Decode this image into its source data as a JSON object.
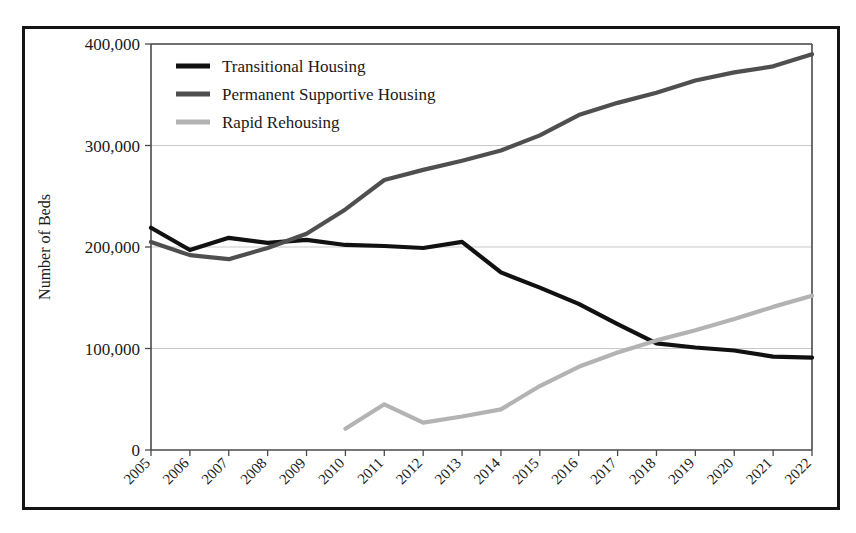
{
  "chart_data": {
    "type": "line",
    "title": "",
    "subtitle": "",
    "xlabel": "",
    "ylabel": "Number of Beds",
    "x": [
      2005,
      2006,
      2007,
      2008,
      2009,
      2010,
      2011,
      2012,
      2013,
      2014,
      2015,
      2016,
      2017,
      2018,
      2019,
      2020,
      2021,
      2022
    ],
    "categories": [
      "2005",
      "2006",
      "2007",
      "2008",
      "2009",
      "2010",
      "2011",
      "2012",
      "2013",
      "2014",
      "2015",
      "2016",
      "2017",
      "2018",
      "2019",
      "2020",
      "2021",
      "2022"
    ],
    "xlim": [
      2005,
      2022
    ],
    "ylim": [
      0,
      400000
    ],
    "yticks": [
      0,
      100000,
      200000,
      300000,
      400000
    ],
    "ytick_labels": [
      "0",
      "100,000",
      "200,000",
      "300,000",
      "400,000"
    ],
    "grid": "horizontal",
    "legend_position": "top-left inside plot area",
    "series": [
      {
        "name": "Transitional Housing",
        "color": "#111111",
        "linewidth": 4.2,
        "values": [
          219000,
          197000,
          209000,
          204000,
          207000,
          202000,
          201000,
          199000,
          205000,
          175000,
          160000,
          144000,
          124000,
          105000,
          101000,
          98000,
          92000,
          91000
        ]
      },
      {
        "name": "Permanent Supportive Housing",
        "color": "#4f4f4f",
        "linewidth": 4.2,
        "values": [
          205000,
          192000,
          188000,
          199000,
          213000,
          237000,
          266000,
          276000,
          285000,
          295000,
          310000,
          330000,
          342000,
          352000,
          364000,
          372000,
          378000,
          390000
        ]
      },
      {
        "name": "Rapid Rehousing",
        "color": "#b3b3b3",
        "linewidth": 4.2,
        "values": [
          null,
          null,
          null,
          null,
          null,
          21000,
          45000,
          27000,
          33000,
          40000,
          63000,
          82000,
          96000,
          108000,
          118000,
          129000,
          141000,
          152000
        ]
      }
    ]
  },
  "yaxis": {
    "title": "Number of Beds",
    "ticks": [
      "400,000",
      "300,000",
      "200,000",
      "100,000",
      "0"
    ]
  },
  "xaxis": {
    "ticks": [
      "2005",
      "2006",
      "2007",
      "2008",
      "2009",
      "2010",
      "2011",
      "2012",
      "2013",
      "2014",
      "2015",
      "2016",
      "2017",
      "2018",
      "2019",
      "2020",
      "2021",
      "2022"
    ]
  },
  "legend": {
    "items": [
      {
        "label": "Transitional Housing",
        "color": "#111111"
      },
      {
        "label": "Permanent Supportive Housing",
        "color": "#4f4f4f"
      },
      {
        "label": "Rapid Rehousing",
        "color": "#b3b3b3"
      }
    ]
  },
  "colors": {
    "transitional_housing": "#111111",
    "permanent_supportive_housing": "#4f4f4f",
    "rapid_rehousing": "#b3b3b3",
    "frame": "#141414",
    "gridline": "#c9c9c9",
    "axis": "#4a4a4a",
    "background": "#ffffff"
  }
}
